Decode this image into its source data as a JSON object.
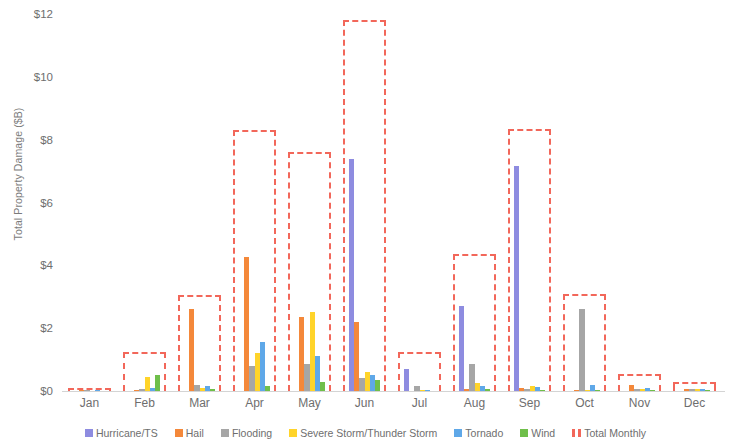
{
  "chart_data": {
    "type": "bar",
    "title": "",
    "xlabel": "",
    "ylabel": "Total Property Damage ($B)",
    "ylim": [
      0,
      12
    ],
    "ytick_labels": [
      "$12",
      "$10",
      "$8",
      "$6",
      "$4",
      "$2",
      "$0"
    ],
    "ytick_values": [
      12,
      10,
      8,
      6,
      4,
      2,
      0
    ],
    "grid": false,
    "legend_position": "bottom",
    "categories": [
      "Jan",
      "Feb",
      "Mar",
      "Apr",
      "May",
      "Jun",
      "Jul",
      "Aug",
      "Sep",
      "Oct",
      "Nov",
      "Dec"
    ],
    "series": [
      {
        "name": "Hurricane/TS",
        "color": "#8e8ce0",
        "values": [
          0.0,
          0.0,
          0.0,
          0.0,
          0.0,
          7.4,
          0.7,
          2.7,
          7.15,
          0.0,
          0.0,
          0.0
        ]
      },
      {
        "name": "Hail",
        "color": "#f4883a",
        "values": [
          0.02,
          0.02,
          2.6,
          4.25,
          2.35,
          2.2,
          0.0,
          0.05,
          0.1,
          0.03,
          0.2,
          0.05
        ]
      },
      {
        "name": "Flooding",
        "color": "#a6a6a6",
        "values": [
          0.02,
          0.05,
          0.2,
          0.8,
          0.85,
          0.4,
          0.15,
          0.85,
          0.05,
          2.6,
          0.05,
          0.05
        ]
      },
      {
        "name": "Severe Storm/Thunder Storm",
        "color": "#ffd42a",
        "values": [
          0.0,
          0.45,
          0.1,
          1.2,
          2.5,
          0.6,
          0.02,
          0.25,
          0.15,
          0.03,
          0.05,
          0.05
        ]
      },
      {
        "name": "Tornado",
        "color": "#5fa8e8",
        "values": [
          0.03,
          0.1,
          0.15,
          1.55,
          1.1,
          0.5,
          0.03,
          0.15,
          0.12,
          0.2,
          0.1,
          0.08
        ]
      },
      {
        "name": "Wind",
        "color": "#6fbf4a",
        "values": [
          0.0,
          0.5,
          0.05,
          0.15,
          0.3,
          0.35,
          0.0,
          0.05,
          0.03,
          0.02,
          0.02,
          0.03
        ]
      }
    ],
    "total_series": {
      "name": "Total Monthly",
      "color": "#f2675a",
      "style": "dashed-outline",
      "values": [
        0.1,
        1.25,
        3.05,
        8.3,
        7.6,
        11.8,
        1.25,
        4.35,
        8.35,
        3.1,
        0.55,
        0.3
      ]
    }
  },
  "legend": {
    "items": [
      {
        "label": "Hurricane/TS",
        "color": "#8e8ce0",
        "style": "solid"
      },
      {
        "label": "Hail",
        "color": "#f4883a",
        "style": "solid"
      },
      {
        "label": "Flooding",
        "color": "#a6a6a6",
        "style": "solid"
      },
      {
        "label": "Severe Storm/Thunder Storm",
        "color": "#ffd42a",
        "style": "solid"
      },
      {
        "label": "Tornado",
        "color": "#5fa8e8",
        "style": "solid"
      },
      {
        "label": "Wind",
        "color": "#6fbf4a",
        "style": "solid"
      },
      {
        "label": "Total Monthly",
        "color": "#f2675a",
        "style": "dashed"
      }
    ]
  }
}
